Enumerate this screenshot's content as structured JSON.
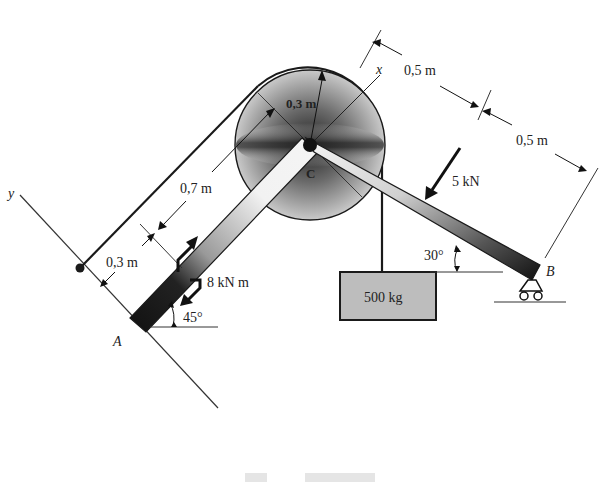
{
  "figure": {
    "title": "",
    "points": {
      "A": "A",
      "B": "B",
      "C": "C"
    },
    "axes": {
      "x": "x",
      "y": "y"
    },
    "dimensions": {
      "pulley_radius": "0,3 m",
      "cable_offset": "0,7 m",
      "moment_offset": "0,3 m",
      "cb_first": "0,5 m",
      "cb_second": "0,5 m"
    },
    "loads": {
      "force": "5 kN",
      "moment": "8 kN m",
      "mass": "500 kg"
    },
    "angles": {
      "bar_ac": "45°",
      "bar_cb": "30°"
    },
    "colors": {
      "ink": "#1a1a1a",
      "pulley_dark": "#2a2a2a",
      "pulley_light": "#e8e8e8",
      "block_fill": "#bdbdbd"
    }
  }
}
